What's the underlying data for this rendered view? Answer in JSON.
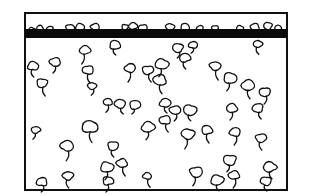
{
  "diagram": {
    "frame": {
      "x": 25,
      "y": 13,
      "width": 262,
      "height": 177,
      "stroke": "#111111",
      "stroke_width": 2
    },
    "bar": {
      "x": 25,
      "y": 29,
      "width": 262,
      "height": 9,
      "fill": "#0a0a0a"
    },
    "ink_color": "#111111",
    "top_blobs": [
      {
        "x": 32,
        "y": 30,
        "r": 3
      },
      {
        "x": 40,
        "y": 28,
        "r": 3
      },
      {
        "x": 50,
        "y": 29,
        "r": 3
      },
      {
        "x": 70,
        "y": 28,
        "r": 4
      },
      {
        "x": 80,
        "y": 27,
        "r": 4
      },
      {
        "x": 95,
        "y": 27,
        "r": 4
      },
      {
        "x": 125,
        "y": 27,
        "r": 3
      },
      {
        "x": 133,
        "y": 26,
        "r": 4
      },
      {
        "x": 143,
        "y": 28,
        "r": 4
      },
      {
        "x": 170,
        "y": 27,
        "r": 4
      },
      {
        "x": 185,
        "y": 27,
        "r": 4
      },
      {
        "x": 200,
        "y": 28,
        "r": 3
      },
      {
        "x": 215,
        "y": 28,
        "r": 3
      },
      {
        "x": 240,
        "y": 28,
        "r": 3
      },
      {
        "x": 255,
        "y": 27,
        "r": 4
      },
      {
        "x": 268,
        "y": 26,
        "r": 4
      },
      {
        "x": 278,
        "y": 28,
        "r": 3
      }
    ],
    "organisms": [
      {
        "x": 33,
        "y": 66,
        "r": 5,
        "stalk": 7
      },
      {
        "x": 55,
        "y": 62,
        "r": 5,
        "stalk": 7
      },
      {
        "x": 42,
        "y": 83,
        "r": 5,
        "stalk": 9
      },
      {
        "x": 85,
        "y": 50,
        "r": 5,
        "stalk": 10
      },
      {
        "x": 88,
        "y": 70,
        "r": 5,
        "stalk": 9
      },
      {
        "x": 92,
        "y": 86,
        "r": 4,
        "stalk": 6
      },
      {
        "x": 115,
        "y": 45,
        "r": 5,
        "stalk": 6
      },
      {
        "x": 130,
        "y": 68,
        "r": 5,
        "stalk": 10
      },
      {
        "x": 148,
        "y": 70,
        "r": 5,
        "stalk": 8
      },
      {
        "x": 162,
        "y": 64,
        "r": 6,
        "stalk": 8
      },
      {
        "x": 160,
        "y": 80,
        "r": 6,
        "stalk": 9
      },
      {
        "x": 178,
        "y": 48,
        "r": 5,
        "stalk": 6
      },
      {
        "x": 185,
        "y": 58,
        "r": 5,
        "stalk": 7
      },
      {
        "x": 193,
        "y": 45,
        "r": 4,
        "stalk": 5
      },
      {
        "x": 215,
        "y": 66,
        "r": 5,
        "stalk": 10
      },
      {
        "x": 230,
        "y": 78,
        "r": 6,
        "stalk": 8
      },
      {
        "x": 248,
        "y": 85,
        "r": 6,
        "stalk": 9
      },
      {
        "x": 265,
        "y": 92,
        "r": 5,
        "stalk": 8
      },
      {
        "x": 258,
        "y": 44,
        "r": 4,
        "stalk": 7
      },
      {
        "x": 108,
        "y": 102,
        "r": 4,
        "stalk": 7
      },
      {
        "x": 120,
        "y": 104,
        "r": 5,
        "stalk": 6
      },
      {
        "x": 135,
        "y": 105,
        "r": 5,
        "stalk": 5
      },
      {
        "x": 165,
        "y": 103,
        "r": 5,
        "stalk": 6
      },
      {
        "x": 175,
        "y": 110,
        "r": 5,
        "stalk": 7
      },
      {
        "x": 190,
        "y": 110,
        "r": 6,
        "stalk": 6
      },
      {
        "x": 232,
        "y": 108,
        "r": 5,
        "stalk": 8
      },
      {
        "x": 258,
        "y": 108,
        "r": 5,
        "stalk": 7
      },
      {
        "x": 36,
        "y": 130,
        "r": 4,
        "stalk": 6
      },
      {
        "x": 90,
        "y": 127,
        "r": 7,
        "stalk": 10
      },
      {
        "x": 67,
        "y": 146,
        "r": 6,
        "stalk": 10
      },
      {
        "x": 113,
        "y": 146,
        "r": 5,
        "stalk": 7
      },
      {
        "x": 148,
        "y": 127,
        "r": 6,
        "stalk": 8
      },
      {
        "x": 165,
        "y": 120,
        "r": 5,
        "stalk": 8
      },
      {
        "x": 188,
        "y": 134,
        "r": 6,
        "stalk": 10
      },
      {
        "x": 207,
        "y": 130,
        "r": 5,
        "stalk": 9
      },
      {
        "x": 235,
        "y": 132,
        "r": 5,
        "stalk": 9
      },
      {
        "x": 261,
        "y": 138,
        "r": 5,
        "stalk": 8
      },
      {
        "x": 107,
        "y": 167,
        "r": 6,
        "stalk": 8
      },
      {
        "x": 122,
        "y": 163,
        "r": 5,
        "stalk": 9
      },
      {
        "x": 230,
        "y": 160,
        "r": 6,
        "stalk": 7
      },
      {
        "x": 270,
        "y": 167,
        "r": 6,
        "stalk": 7
      },
      {
        "x": 42,
        "y": 182,
        "r": 5,
        "stalk": 6
      },
      {
        "x": 68,
        "y": 176,
        "r": 5,
        "stalk": 8
      },
      {
        "x": 108,
        "y": 181,
        "r": 5,
        "stalk": 7
      },
      {
        "x": 147,
        "y": 176,
        "r": 4,
        "stalk": 8
      },
      {
        "x": 196,
        "y": 172,
        "r": 6,
        "stalk": 9
      },
      {
        "x": 217,
        "y": 180,
        "r": 6,
        "stalk": 6
      },
      {
        "x": 234,
        "y": 175,
        "r": 5,
        "stalk": 9
      },
      {
        "x": 266,
        "y": 181,
        "r": 5,
        "stalk": 6
      }
    ]
  }
}
